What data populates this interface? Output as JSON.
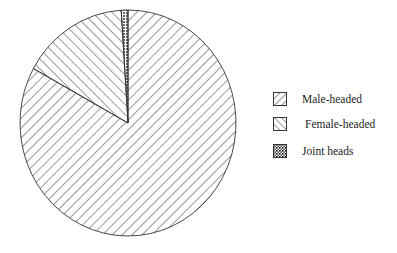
{
  "chart_data": {
    "type": "pie",
    "title": "",
    "categories": [
      "Male-headed",
      "Female-headed",
      "Joint heads"
    ],
    "values": [
      83,
      16,
      1
    ],
    "unit": "percent (estimated from slice angles)",
    "start_angle": "12 o'clock, slices drawn counterclockwise: Joint heads, Female-headed, Male-headed",
    "patterns": {
      "Male-headed": "forward diagonal hatch (/)",
      "Female-headed": "backward diagonal hatch (\\)",
      "Joint heads": "dotted / stippled"
    },
    "legend_position": "right",
    "legend": [
      {
        "label": "Male-headed",
        "pattern": "hatch-forward"
      },
      {
        "label": "Female-headed",
        "pattern": "hatch-back"
      },
      {
        "label": "Joint heads",
        "pattern": "dots"
      }
    ]
  },
  "legend": {
    "items": [
      {
        "label": "Male-headed"
      },
      {
        "label": "Female-headed"
      },
      {
        "label": "Joint heads"
      }
    ]
  },
  "colors": {
    "stroke": "#333333",
    "background": "#ffffff"
  }
}
